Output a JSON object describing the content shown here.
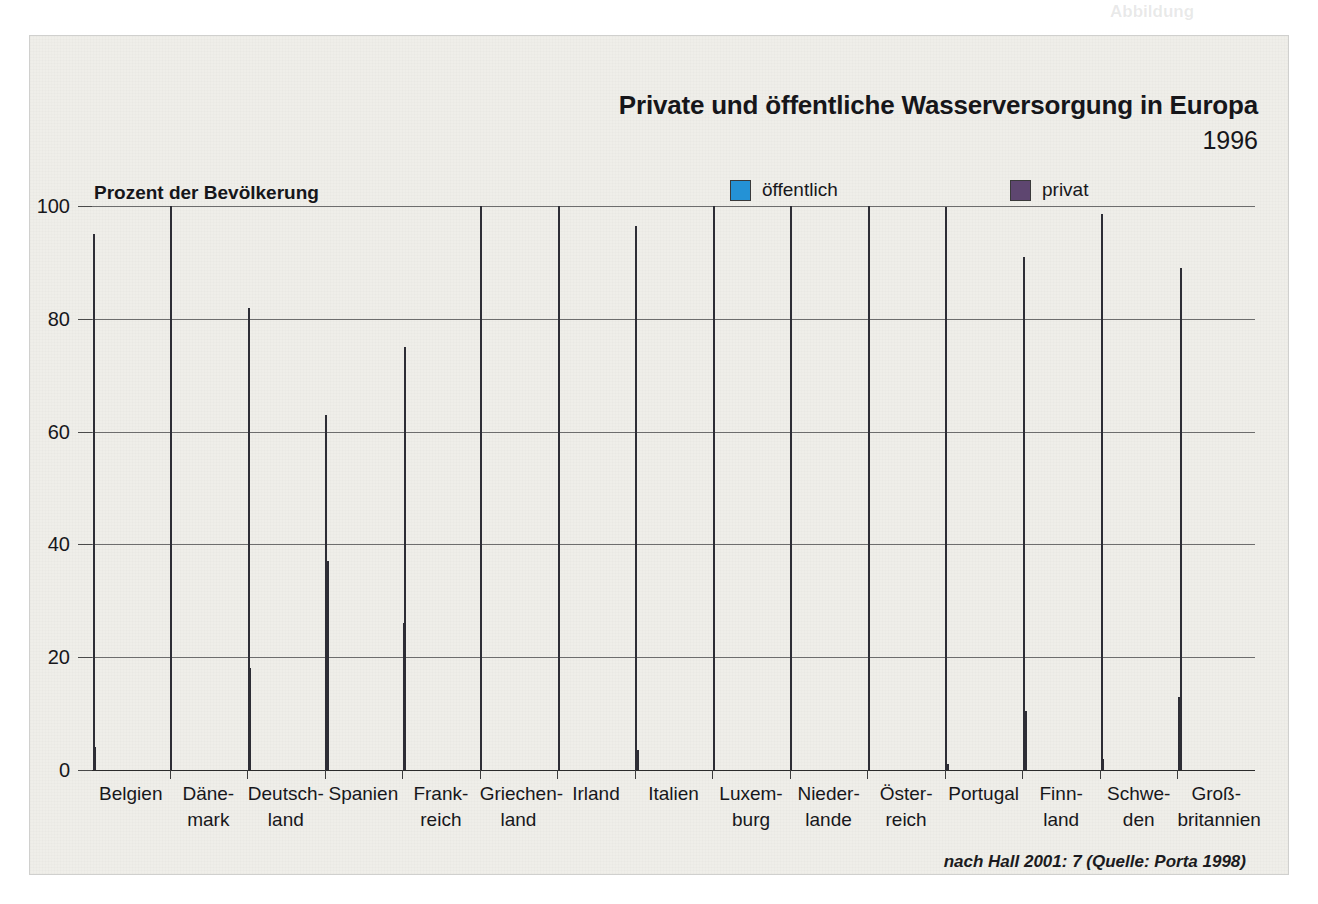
{
  "bleed_through": {
    "top_right": "Abbildung",
    "heading": "Wasserversorgung der Privatisierung",
    "line1": "der Wasserversorgung weit",
    "line2": "verbreitet"
  },
  "chart_panel": {
    "title": "Private und öffentliche Wasserversorgung in Europa",
    "year": "1996",
    "y_axis_title": "Prozent der Bevölkerung",
    "source_note": "nach Hall 2001: 7 (Quelle: Porta 1998)",
    "legend": [
      {
        "name": "public-legend",
        "label": "öffentlich",
        "color": "#2492d6"
      },
      {
        "name": "private-legend",
        "label": "privat",
        "color": "#5e4670"
      }
    ]
  },
  "chart_data": {
    "type": "bar",
    "title": "Private und öffentliche Wasserversorgung in Europa",
    "subtitle": "1996",
    "xlabel": "",
    "ylabel": "Prozent der Bevölkerung",
    "ylim": [
      0,
      100
    ],
    "yticks": [
      0,
      20,
      40,
      60,
      80,
      100
    ],
    "ytick_labels": [
      "0",
      "20",
      "40",
      "60",
      "80",
      "100"
    ],
    "grid": true,
    "legend_position": "top-right",
    "categories": [
      "Belgien",
      "Dänemark",
      "Deutschland",
      "Spanien",
      "Frankreich",
      "Griechenland",
      "Irland",
      "Italien",
      "Luxemburg",
      "Niederlande",
      "Österreich",
      "Portugal",
      "Finnland",
      "Schweden",
      "Großbritannien"
    ],
    "category_lines": [
      [
        "Belgien",
        ""
      ],
      [
        "Däne-",
        "mark"
      ],
      [
        "Deutsch-",
        "land"
      ],
      [
        "Spanien",
        ""
      ],
      [
        "Frank-",
        "reich"
      ],
      [
        "Griechen-",
        "land"
      ],
      [
        "Irland",
        ""
      ],
      [
        "Italien",
        ""
      ],
      [
        "Luxem-",
        "burg"
      ],
      [
        "Nieder-",
        "lande"
      ],
      [
        "Öster-",
        "reich"
      ],
      [
        "Portugal",
        ""
      ],
      [
        "Finn-",
        "land"
      ],
      [
        "Schwe-",
        "den"
      ],
      [
        "Groß-",
        "britannien"
      ]
    ],
    "series": [
      {
        "name": "öffentlich",
        "color": "#2492d6",
        "values": [
          95,
          100,
          82,
          63,
          26,
          100,
          100,
          96.5,
          100,
          100,
          100,
          99.8,
          91,
          98.5,
          13
        ]
      },
      {
        "name": "privat",
        "color": "#5e4670",
        "values": [
          4,
          0,
          18,
          37,
          75,
          0,
          0,
          3.5,
          0,
          0,
          0,
          1,
          10.5,
          2,
          89
        ]
      }
    ],
    "annotation": "nach Hall 2001: 7 (Quelle: Porta 1998)"
  }
}
